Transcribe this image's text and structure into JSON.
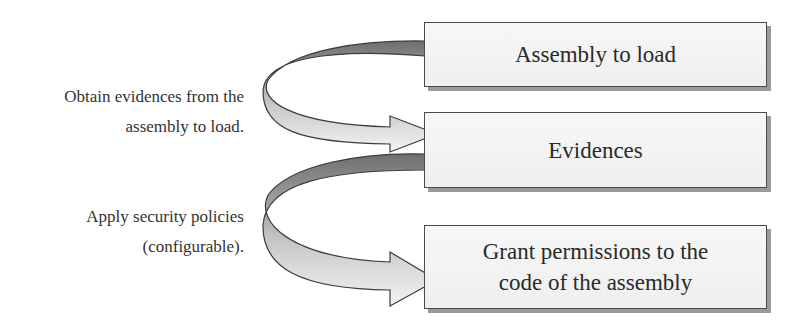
{
  "diagram": {
    "boxes": [
      {
        "id": "assembly",
        "lines": [
          "Assembly to load"
        ]
      },
      {
        "id": "evidences",
        "lines": [
          "Evidences"
        ]
      },
      {
        "id": "grant",
        "lines": [
          "Grant permissions to the",
          "code of the assembly"
        ]
      }
    ],
    "arrows": [
      {
        "from": "assembly",
        "to": "evidences",
        "label_lines": [
          "Obtain evidences from the",
          "assembly to load."
        ]
      },
      {
        "from": "evidences",
        "to": "grant",
        "label_lines": [
          "Apply security policies",
          "(configurable)."
        ]
      }
    ],
    "colors": {
      "box_fill": "#f2f2f2",
      "box_border": "#4a4a4a",
      "box_shadow": "#9a9a9a",
      "arrow_dark": "#7a7a7a",
      "arrow_light": "#f2f2f2",
      "text": "#2a2a2a"
    }
  }
}
